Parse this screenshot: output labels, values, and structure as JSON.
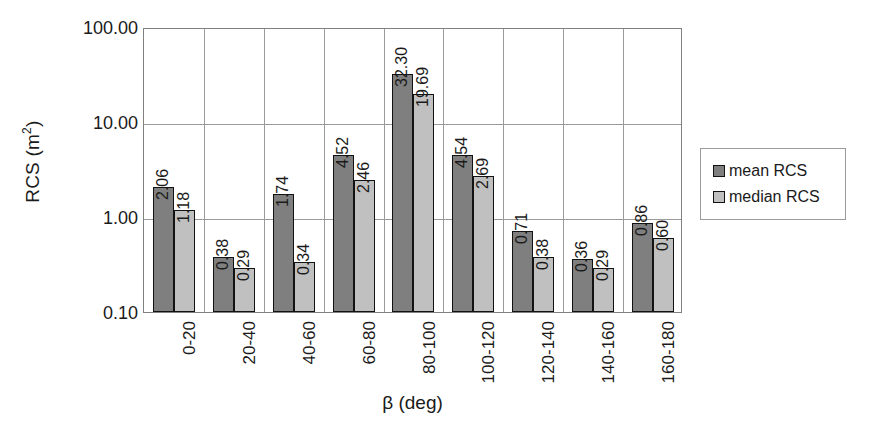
{
  "chart_data": {
    "type": "bar",
    "title": "",
    "xlabel": "β (deg)",
    "ylabel": "RCS (m²)",
    "ylabel_base": "RCS (m",
    "ylabel_sup": "2",
    "ylabel_tail": ")",
    "yscale": "log",
    "ylim": [
      0.1,
      100.0
    ],
    "grid": "both",
    "legend_position": "right",
    "ytick_labels": [
      "100.00",
      "10.00",
      "1.00",
      "0.10"
    ],
    "ytick_values": [
      100.0,
      10.0,
      1.0,
      0.1
    ],
    "categories": [
      "0-20",
      "20-40",
      "40-60",
      "60-80",
      "80-100",
      "100-120",
      "120-140",
      "140-160",
      "160-180"
    ],
    "series": [
      {
        "name": "mean RCS",
        "color": "#7f7f7f",
        "values": [
          2.06,
          0.38,
          1.74,
          4.52,
          32.3,
          4.54,
          0.71,
          0.36,
          0.86
        ],
        "labels": [
          "2.06",
          "0.38",
          "1.74",
          "4.52",
          "32.30",
          "4.54",
          "0.71",
          "0.36",
          "0.86"
        ]
      },
      {
        "name": "median RCS",
        "color": "#c0c0c0",
        "values": [
          1.18,
          0.29,
          0.34,
          2.46,
          19.69,
          2.69,
          0.38,
          0.29,
          0.6
        ],
        "labels": [
          "1.18",
          "0.29",
          "0.34",
          "2.46",
          "19.69",
          "2.69",
          "0.38",
          "0.29",
          "0.60"
        ]
      }
    ]
  },
  "legend": {
    "items": [
      {
        "label": "mean RCS",
        "swatch": "mean"
      },
      {
        "label": "median RCS",
        "swatch": "median"
      }
    ]
  }
}
